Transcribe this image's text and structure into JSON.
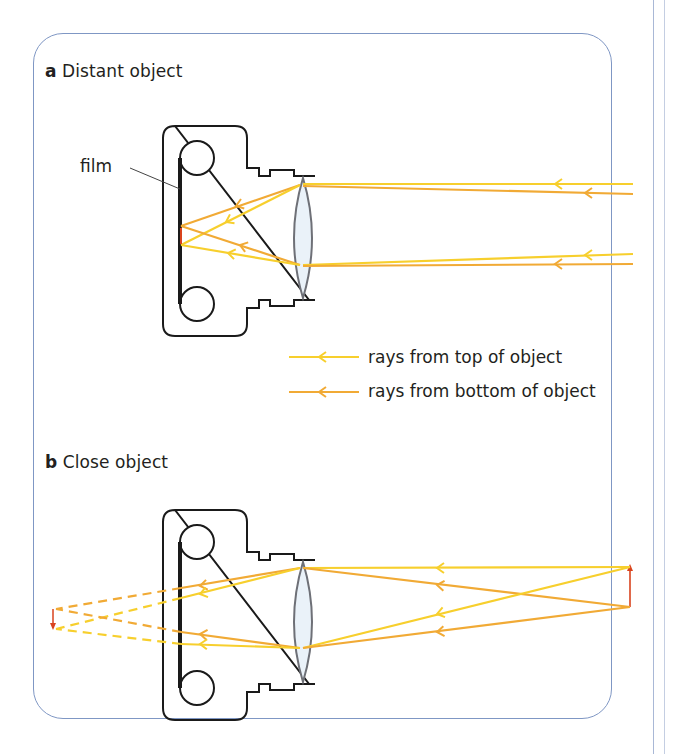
{
  "colors": {
    "ray_top": "#f7cf2d",
    "ray_bottom": "#f1aa35",
    "outline": "#1a1a1a",
    "lens_fill": "#eaf2f9",
    "lens_stroke": "#6e7077",
    "arrow_red": "#d9431e",
    "frame": "#7f97c4"
  },
  "panel_a": {
    "letter": "a",
    "title": "Distant object",
    "labels": {
      "film": "film"
    }
  },
  "legend": {
    "items": [
      {
        "label": "rays from top of object",
        "color_key": "ray_top"
      },
      {
        "label": "rays from bottom of object",
        "color_key": "ray_bottom"
      }
    ]
  },
  "panel_b": {
    "letter": "b",
    "title": "Close object"
  }
}
